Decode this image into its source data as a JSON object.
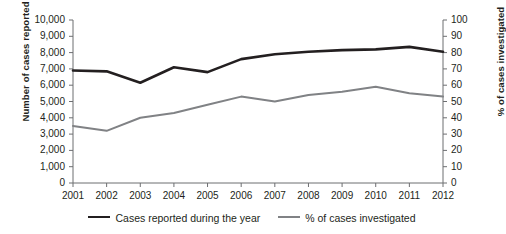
{
  "chart_data": {
    "type": "line",
    "title": "",
    "subtitle": "",
    "xlabel": "",
    "ylabel": "Number of cases reported",
    "ylabel_right": "% of cases investigated",
    "categories": [
      "2001",
      "2002",
      "2003",
      "2004",
      "2005",
      "2006",
      "2007",
      "2008",
      "2009",
      "2010",
      "2011",
      "2012"
    ],
    "x": [
      2001,
      2002,
      2003,
      2004,
      2005,
      2006,
      2007,
      2008,
      2009,
      2010,
      2011,
      2012
    ],
    "ylim": [
      0,
      10000
    ],
    "ylim_right": [
      0,
      100
    ],
    "yticks": [
      0,
      1000,
      2000,
      3000,
      4000,
      5000,
      6000,
      7000,
      8000,
      9000,
      10000
    ],
    "ytick_labels": [
      "0",
      "1,000",
      "2,000",
      "3,000",
      "4,000",
      "5,000",
      "6,000",
      "7,000",
      "8,000",
      "9,000",
      "10,000"
    ],
    "yticks_right": [
      0,
      10,
      20,
      30,
      40,
      50,
      60,
      70,
      80,
      90,
      100
    ],
    "ytick_labels_right": [
      "0",
      "10",
      "20",
      "30",
      "40",
      "50",
      "60",
      "70",
      "80",
      "90",
      "100"
    ],
    "grid": false,
    "legend_position": "bottom",
    "series": [
      {
        "name": "Cases reported during the year",
        "axis": "left",
        "color": "#231f20",
        "width": 2.6,
        "values": [
          6900,
          6850,
          6150,
          7100,
          6800,
          7600,
          7900,
          8050,
          8150,
          8200,
          8350,
          8050
        ]
      },
      {
        "name": "% of cases investigated",
        "axis": "right",
        "color": "#808285",
        "width": 2.0,
        "values": [
          35,
          32,
          40,
          43,
          48,
          53,
          50,
          54,
          56,
          59,
          55,
          53
        ]
      }
    ]
  },
  "legend": {
    "items": [
      {
        "label": "Cases reported during the year"
      },
      {
        "label": "% of cases investigated"
      }
    ]
  },
  "axes": {
    "left_title": "Number of cases reported",
    "right_title": "% of cases investigated"
  }
}
